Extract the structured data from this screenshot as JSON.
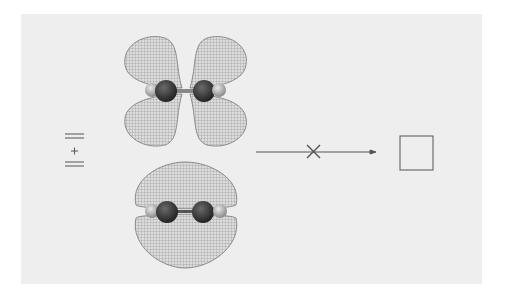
{
  "figure": {
    "type": "reaction-scheme",
    "reactants_label": "=\n+\n=",
    "reactant_symbol_plus": "+",
    "arrow": {
      "status": "forbidden",
      "mark": "×"
    },
    "product": "cyclobutane (square)",
    "orbitals": [
      {
        "name": "antibonding-pi-orbital",
        "description": "four-lobe wireframe orbital (top)"
      },
      {
        "name": "bonding-pi-orbital",
        "description": "two-lobe wireframe orbital (bottom)"
      }
    ],
    "colors": {
      "background": "#eeeeee",
      "lobe_fill": "#d9d9d9",
      "lobe_grid": "#8c8c8c",
      "carbon": "#3a3a3a",
      "hydrogen": "#b5b5b5",
      "line": "#555555"
    }
  }
}
